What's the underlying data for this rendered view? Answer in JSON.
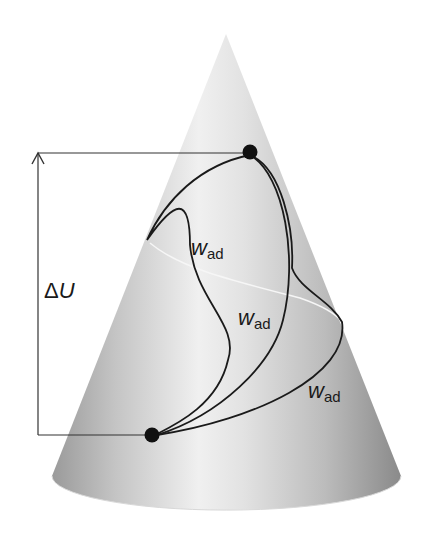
{
  "figure": {
    "height_difference_label": {
      "delta": "Δ",
      "symbol": "U"
    },
    "path_labels": [
      {
        "main": "w",
        "sub": "ad"
      },
      {
        "main": "w",
        "sub": "ad"
      },
      {
        "main": "w",
        "sub": "ad"
      }
    ],
    "colors": {
      "curve": "#1a1a1a",
      "helix": "#f4f4f4",
      "cone_light": "#f2f2f2",
      "cone_dark": "#8f8f8f",
      "dot": "#111111"
    }
  }
}
